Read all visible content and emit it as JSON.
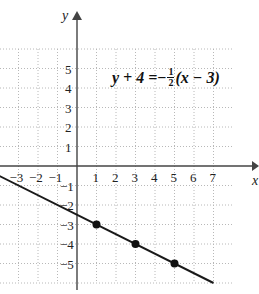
{
  "chart_data": {
    "type": "line",
    "title": "",
    "xlabel": "x",
    "ylabel": "y",
    "xlim": [
      -4,
      8
    ],
    "ylim": [
      -6,
      7
    ],
    "grid": true,
    "x_ticks": [
      "-3",
      "-2",
      "-1",
      "1",
      "2",
      "3",
      "4",
      "5",
      "6",
      "7"
    ],
    "y_ticks": [
      "5",
      "4",
      "3",
      "2",
      "1",
      "-1",
      "-2",
      "-3",
      "-4",
      "-5"
    ],
    "annotation": {
      "lhs": "y + 4 =",
      "sign": "−",
      "frac_num": "1",
      "frac_den": "2",
      "rhs": "(x − 3)"
    },
    "series": [
      {
        "name": "y + 4 = -1/2 (x - 3)",
        "slope": -0.5,
        "intercept": -2.5,
        "x": [
          -4,
          7
        ],
        "y": [
          -0.5,
          -6
        ]
      }
    ],
    "points": [
      {
        "x": 1,
        "y": -3
      },
      {
        "x": 3,
        "y": -4
      },
      {
        "x": 5,
        "y": -5
      }
    ]
  }
}
